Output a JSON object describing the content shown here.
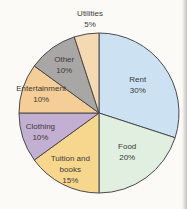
{
  "chart_data": {
    "type": "pie",
    "title": "",
    "legend": "none",
    "direction": "clockwise",
    "start_angle_deg": 0,
    "categories": [
      "Rent",
      "Food",
      "Tuition and books",
      "Clothing",
      "Entertainment",
      "Other",
      "Utilities"
    ],
    "values": [
      30,
      20,
      15,
      10,
      10,
      10,
      5
    ],
    "slices": [
      {
        "name": "Rent",
        "pct": 30,
        "color": "#cce2f3",
        "label_lines": [
          "Rent",
          "30%"
        ],
        "label_r": 0.6
      },
      {
        "name": "Food",
        "pct": 20,
        "color": "#e0efdf",
        "label_lines": [
          "Food",
          "20%"
        ],
        "label_r": 0.6
      },
      {
        "name": "Tuition and books",
        "pct": 15,
        "color": "#f7d78d",
        "label_lines": [
          "Tuition and",
          "books",
          "15%"
        ],
        "label_r": 0.79
      },
      {
        "name": "Clothing",
        "pct": 10,
        "color": "#c3afd1",
        "label_lines": [
          "Clothing",
          "10%"
        ],
        "label_r": 0.77
      },
      {
        "name": "Entertainment",
        "pct": 10,
        "color": "#f5cd97",
        "label_lines": [
          "Entertainment",
          "10%"
        ],
        "label_r": 0.76
      },
      {
        "name": "Other",
        "pct": 10,
        "color": "#a9a7a5",
        "label_lines": [
          "Other",
          "10%"
        ],
        "label_r": 0.74
      },
      {
        "name": "Utilities",
        "pct": 5,
        "color": "#f5d9b3",
        "label_lines": [
          "Utilities",
          "5%"
        ],
        "outside_pos": {
          "x": 90,
          "y": 19
        }
      }
    ],
    "center": {
      "x": 99,
      "y": 113
    },
    "radius": 80,
    "line_height": 11,
    "stroke_color": "#4a4a4a",
    "stroke_width": 1,
    "text_color": "#3a3a3a",
    "background": "#fbfaf6"
  }
}
